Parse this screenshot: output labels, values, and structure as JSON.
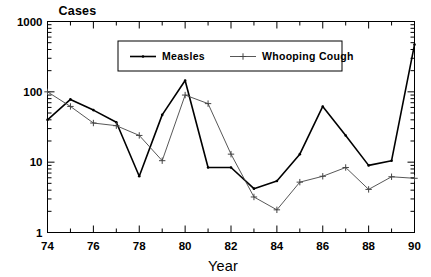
{
  "chart_data": {
    "type": "line",
    "title": "Cases",
    "xlabel": "Year",
    "ylabel": "Cases",
    "yscale": "log",
    "ylim": [
      1,
      1000
    ],
    "ytick_labels": [
      "1",
      "10",
      "100",
      "1000"
    ],
    "ytick_values": [
      1,
      10,
      100,
      1000
    ],
    "xlim": [
      74,
      90
    ],
    "xtick_labels": [
      "74",
      "76",
      "78",
      "80",
      "82",
      "84",
      "86",
      "88",
      "90"
    ],
    "xtick_values": [
      74,
      76,
      78,
      80,
      82,
      84,
      86,
      88,
      90
    ],
    "grid": false,
    "legend_position": "top-center",
    "x": [
      74,
      75,
      76,
      77,
      78,
      79,
      80,
      81,
      82,
      83,
      84,
      85,
      86,
      87,
      88,
      89,
      90
    ],
    "series": [
      {
        "name": "Measles",
        "color": "#000000",
        "marker": "dot",
        "line_width": 1.6,
        "values": [
          40,
          78,
          55,
          37,
          6.3,
          47,
          145,
          8.4,
          8.4,
          4.2,
          5.4,
          13,
          62,
          24,
          9.0,
          10.5,
          470
        ]
      },
      {
        "name": "Whooping Cough",
        "color": "#444444",
        "marker": "plus",
        "line_width": 0.9,
        "values": [
          100,
          62,
          36,
          33,
          24,
          10.5,
          90,
          68,
          13,
          3.2,
          2.1,
          5.2,
          6.3,
          8.4,
          4.1,
          6.2,
          5.9
        ]
      }
    ]
  },
  "legend": {
    "items": [
      {
        "label": "Measles",
        "marker": "dot-line"
      },
      {
        "label": "Whooping Cough",
        "marker": "plus-line"
      }
    ]
  },
  "labels": {
    "y_axis_title": "Cases",
    "x_axis_title": "Year"
  }
}
